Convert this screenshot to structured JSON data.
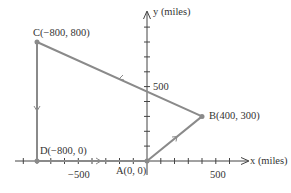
{
  "diagram": {
    "type": "coordinate-path",
    "axes": {
      "x_label": "x (miles)",
      "y_label": "y (miles)",
      "x_tick_label": "−500",
      "x_tick_label_pos": "500",
      "y_tick_label": "500"
    },
    "points": [
      {
        "id": "A",
        "label": "A(0, 0)",
        "x": 0,
        "y": 0
      },
      {
        "id": "B",
        "label": "B(400, 300)",
        "x": 400,
        "y": 300
      },
      {
        "id": "C",
        "label": "C(−800, 800)",
        "x": -800,
        "y": 800
      },
      {
        "id": "D",
        "label": "D(−800, 0)",
        "x": -800,
        "y": 0
      }
    ],
    "path": [
      "A",
      "B",
      "C",
      "D",
      "A"
    ],
    "colors": {
      "path": "#8a8a8a",
      "axes": "#444444",
      "text": "#333333"
    }
  }
}
